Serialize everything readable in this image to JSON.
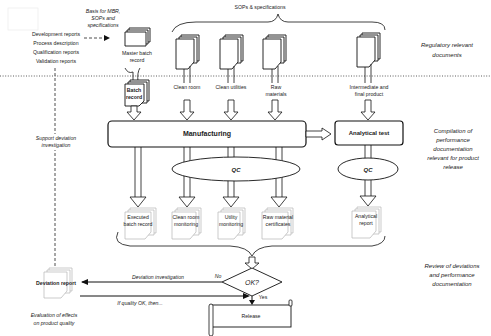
{
  "diagram": {
    "zones": {
      "regulatory": "Regulatory relevant documents",
      "compilation": [
        "Compilation of",
        "performance",
        "documentation",
        "relevant  for product",
        "release"
      ],
      "review": [
        "Review of deviations",
        "and performance",
        "documentation"
      ]
    },
    "zones_regulatory_lines": [
      "Regulatory relevant",
      "documents"
    ],
    "left_reports": [
      "Development reports",
      "Process description",
      "Qualification reports",
      "Validation reports"
    ],
    "basis_note": [
      "Basis for MBR,",
      "SOPs and",
      "specifications"
    ],
    "master_batch_record": [
      "Master batch",
      "record"
    ],
    "batch_record": [
      "Batch",
      "record"
    ],
    "sops_header": "SOPs & specifications",
    "sop_inputs": [
      {
        "label": [
          "Clean room"
        ]
      },
      {
        "label": [
          "Clean utilities"
        ]
      },
      {
        "label": [
          "Raw",
          "materials"
        ]
      },
      {
        "label": [
          "Intermediate and",
          "final product"
        ]
      }
    ],
    "support_note": [
      "Support deviation",
      "investigation"
    ],
    "manufacturing": "Manufacturing",
    "analytical_test": "Analytical test",
    "qc_label": "QC",
    "outputs": [
      {
        "label": [
          "Executed",
          "batch record"
        ]
      },
      {
        "label": [
          "Clean room",
          "monitoring"
        ]
      },
      {
        "label": [
          "Utility",
          "monitoring"
        ]
      },
      {
        "label": [
          "Raw material",
          "certificates"
        ]
      },
      {
        "label": [
          "Analytical",
          "report"
        ]
      }
    ],
    "decision": "OK?",
    "no_label": "No",
    "yes_label": "Yes",
    "deviation_investigation": "Deviation investigation",
    "if_quality_ok": "If quality OK, then...",
    "deviation_report": "Deviation report",
    "evaluation_note": [
      "Evaluation of effects",
      "on product quality"
    ],
    "release": "Release"
  }
}
